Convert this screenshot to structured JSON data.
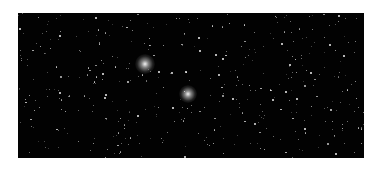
{
  "image": {
    "subject": "star field",
    "background_color": "#020202",
    "frame": {
      "left": 18,
      "top": 13,
      "width": 346,
      "height": 145
    },
    "bright_stars": [
      {
        "x": 127,
        "y": 51,
        "r": 3,
        "glow": 10
      },
      {
        "x": 170,
        "y": 81,
        "r": 3,
        "glow": 9
      }
    ]
  }
}
